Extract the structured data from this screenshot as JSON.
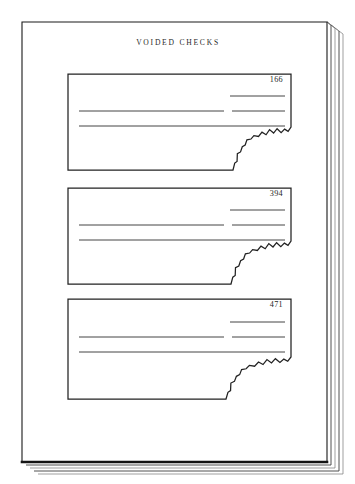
{
  "document": {
    "title": "VOIDED CHECKS",
    "title_x": 178,
    "title_y": 45,
    "background_color": "#ffffff",
    "ink_color": "#222222"
  },
  "book": {
    "name": "bound-ledger-book",
    "page_outline_color": "#1a1a1a",
    "spine_shadow_color": "#141414",
    "page_stack_color": "#3d3d3d",
    "front_page": {
      "left": 22,
      "top": 22,
      "right": 327,
      "bottom": 462
    },
    "stack_edges": [
      {
        "dx": 4,
        "dy": 3
      },
      {
        "dx": 8,
        "dy": 6
      },
      {
        "dx": 12,
        "dy": 9
      },
      {
        "dx": 16,
        "dy": 12
      }
    ]
  },
  "checks": [
    {
      "name": "voided-check-166",
      "number": "166",
      "number_x": 283,
      "number_y": 82,
      "box": {
        "left": 68,
        "top": 74,
        "right": 291,
        "bottom": 170
      },
      "tear_start_x": 233,
      "tear_top_y": 127,
      "rules": [
        {
          "name": "rule-amount-line",
          "x1": 230,
          "x2": 285,
          "y": 96
        },
        {
          "name": "rule-payee-line",
          "x1": 79,
          "x2": 224,
          "y": 111
        },
        {
          "name": "rule-payee-line-right",
          "x1": 232,
          "x2": 285,
          "y": 111
        },
        {
          "name": "rule-memo-line",
          "x1": 79,
          "x2": 285,
          "y": 126
        }
      ]
    },
    {
      "name": "voided-check-394",
      "number": "394",
      "number_x": 283,
      "number_y": 196,
      "box": {
        "left": 68,
        "top": 188,
        "right": 291,
        "bottom": 284
      },
      "tear_start_x": 231,
      "tear_top_y": 241,
      "rules": [
        {
          "name": "rule-amount-line",
          "x1": 230,
          "x2": 285,
          "y": 210
        },
        {
          "name": "rule-payee-line",
          "x1": 79,
          "x2": 224,
          "y": 225
        },
        {
          "name": "rule-payee-line-right",
          "x1": 232,
          "x2": 285,
          "y": 225
        },
        {
          "name": "rule-memo-line",
          "x1": 79,
          "x2": 285,
          "y": 240
        }
      ]
    },
    {
      "name": "voided-check-471",
      "number": "471",
      "number_x": 283,
      "number_y": 307,
      "box": {
        "left": 68,
        "top": 299,
        "right": 291,
        "bottom": 399
      },
      "tear_start_x": 226,
      "tear_top_y": 357,
      "rules": [
        {
          "name": "rule-amount-line",
          "x1": 230,
          "x2": 285,
          "y": 322
        },
        {
          "name": "rule-payee-line",
          "x1": 79,
          "x2": 224,
          "y": 337
        },
        {
          "name": "rule-payee-line-right",
          "x1": 232,
          "x2": 285,
          "y": 337
        },
        {
          "name": "rule-memo-line",
          "x1": 79,
          "x2": 285,
          "y": 352
        }
      ]
    }
  ],
  "tear_profile": {
    "description": "jagged torn right-bottom corner of each check stub",
    "points": [
      [
        0.0,
        1.0
      ],
      [
        0.03,
        0.84
      ],
      [
        0.07,
        0.8
      ],
      [
        0.075,
        0.62
      ],
      [
        0.13,
        0.58
      ],
      [
        0.16,
        0.46
      ],
      [
        0.21,
        0.42
      ],
      [
        0.24,
        0.3
      ],
      [
        0.31,
        0.28
      ],
      [
        0.36,
        0.2
      ],
      [
        0.44,
        0.22
      ],
      [
        0.5,
        0.12
      ],
      [
        0.57,
        0.18
      ],
      [
        0.63,
        0.06
      ],
      [
        0.7,
        0.14
      ],
      [
        0.76,
        0.04
      ],
      [
        0.83,
        0.13
      ],
      [
        0.89,
        0.05
      ],
      [
        0.95,
        0.1
      ],
      [
        1.0,
        0.0
      ]
    ]
  }
}
